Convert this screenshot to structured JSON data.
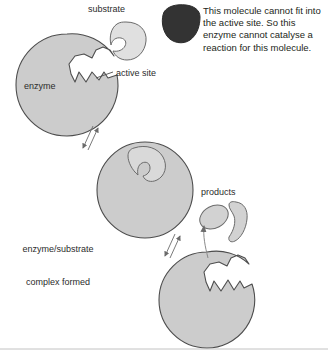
{
  "diagram": {
    "labels": {
      "substrate": "substrate",
      "active_site": "active site",
      "enzyme": "enzyme",
      "complex_line1": "enzyme/substrate",
      "complex_line2": "complex formed",
      "products": "products"
    },
    "callout": {
      "text": "This molecule cannot fit into the active site. So this enzyme cannot catalyse a reaction for this molecule."
    },
    "colors": {
      "enzyme_fill": "#cccccc",
      "substrate_fill": "#e0e0e0",
      "bound_substrate_fill": "#d9d9d9",
      "product_fill": "#d2d2d2",
      "wrong_molecule_fill": "#333333",
      "outline": "#4d4d4d",
      "text": "#2b2b2b",
      "background": "#ffffff",
      "bottom_rule": "#b3b3b3"
    },
    "shapes": [
      {
        "name": "enzyme-circle-free",
        "kind": "circle",
        "cx": 67,
        "cy": 85,
        "r": 51,
        "state": "active site empty"
      },
      {
        "name": "substrate-free",
        "kind": "blob",
        "cx": 127,
        "cy": 41,
        "state": "unbound"
      },
      {
        "name": "wrong-molecule",
        "kind": "blob",
        "cx": 181,
        "cy": 23,
        "state": "cannot bind"
      },
      {
        "name": "enzyme-circle-bound",
        "kind": "circle",
        "cx": 145,
        "cy": 190,
        "r": 48,
        "state": "substrate bound"
      },
      {
        "name": "enzyme-circle-released",
        "kind": "circle",
        "cx": 207,
        "cy": 300,
        "r": 48,
        "state": "products released"
      },
      {
        "name": "product-oval",
        "kind": "oval",
        "cx": 214,
        "cy": 217,
        "state": "released"
      },
      {
        "name": "product-bean",
        "kind": "bean",
        "cx": 238,
        "cy": 222,
        "state": "released"
      }
    ],
    "arrows": [
      {
        "name": "reversible-arrow-1",
        "from": "enzyme-circle-free",
        "to": "enzyme-circle-bound",
        "type": "reversible"
      },
      {
        "name": "reversible-arrow-2",
        "from": "enzyme-circle-bound",
        "to": "enzyme-circle-released",
        "type": "reversible"
      },
      {
        "name": "products-release-arrow",
        "from": "enzyme-circle-released",
        "to": "products",
        "type": "single"
      }
    ]
  }
}
